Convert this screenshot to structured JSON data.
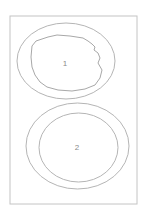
{
  "diagram": {
    "frame": {
      "x": 10,
      "y": 16,
      "width": 127,
      "height": 188,
      "stroke": "#c4c4c4"
    },
    "line_color": "#b5b5b5",
    "regions": [
      {
        "id": 1,
        "label": "1",
        "outer": {
          "cx": 66,
          "cy": 61,
          "rx": 49,
          "ry": 38
        },
        "inner_shape": "irregular",
        "label_pos": {
          "x": 65,
          "y": 66
        }
      },
      {
        "id": 2,
        "label": "2",
        "outer": {
          "cx": 77.5,
          "cy": 146,
          "rx": 51.5,
          "ry": 43
        },
        "inner": {
          "cx": 78.5,
          "cy": 147.5,
          "rx": 39.5,
          "ry": 34.5
        },
        "label_pos": {
          "x": 77,
          "y": 150
        }
      }
    ]
  }
}
